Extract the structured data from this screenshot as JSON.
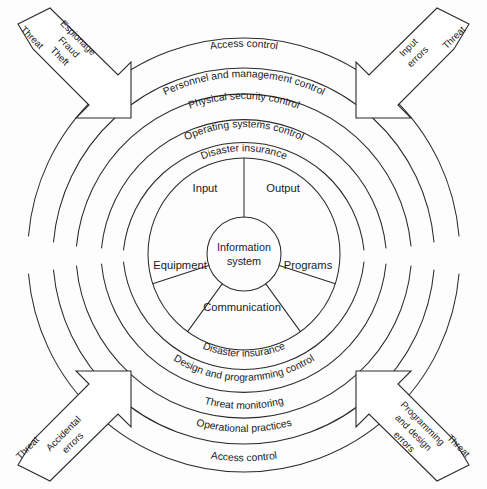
{
  "diagram": {
    "center": {
      "label_line1": "Information",
      "label_line2": "system"
    },
    "segments": [
      {
        "id": "input",
        "label": "Input"
      },
      {
        "id": "output",
        "label": "Output"
      },
      {
        "id": "programs",
        "label": "Programs"
      },
      {
        "id": "communication",
        "label": "Communication"
      },
      {
        "id": "equipment",
        "label": "Equipment"
      }
    ],
    "upper_rings": [
      {
        "index": 1,
        "label": "Access control"
      },
      {
        "index": 2,
        "label": "Personnel and management control"
      },
      {
        "index": 3,
        "label": "Physical security control"
      },
      {
        "index": 4,
        "label": "Operating systems control"
      },
      {
        "index": 5,
        "label": "Disaster insurance"
      }
    ],
    "lower_rings": [
      {
        "index": 1,
        "label": "Disaster insurance"
      },
      {
        "index": 2,
        "label": "Design and programming control"
      },
      {
        "index": 3,
        "label": "Threat monitoring"
      },
      {
        "index": 4,
        "label": "Operational practices"
      },
      {
        "index": 5,
        "label": "Access control"
      }
    ],
    "threat_arrows": [
      {
        "id": "top-left",
        "threat_word": "Threat",
        "lines": [
          "Espionage",
          "Fraud",
          "Theft"
        ]
      },
      {
        "id": "top-right",
        "threat_word": "Threat",
        "lines": [
          "Input",
          "errors"
        ]
      },
      {
        "id": "bottom-left",
        "threat_word": "Threat",
        "lines": [
          "Accidental",
          "errors"
        ]
      },
      {
        "id": "bottom-right",
        "threat_word": "Threat",
        "lines": [
          "Programming",
          "and design",
          "errors"
        ]
      }
    ],
    "colors": {
      "stroke": "#2b2b2b",
      "background": "#fdfdfd",
      "text": "#1b1b1b"
    }
  }
}
